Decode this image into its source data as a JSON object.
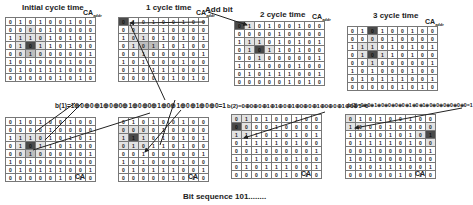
{
  "panels_top": [
    {
      "title": "Initial cycle time",
      "ca_label": "CA",
      "ca_sub": "addr",
      "x": 5,
      "y": 17,
      "title_x": 22,
      "title_y": 4,
      "rows": [
        [
          0,
          1,
          0,
          1,
          0,
          0,
          1,
          0,
          0
        ],
        [
          0,
          0,
          0,
          0,
          1,
          0,
          0,
          0,
          0
        ],
        [
          1,
          1,
          1,
          0,
          1,
          0,
          1,
          0,
          1
        ],
        [
          0,
          1,
          0,
          1,
          1,
          0,
          1,
          0,
          0
        ],
        [
          0,
          0,
          1,
          0,
          0,
          0,
          0,
          0,
          1
        ],
        [
          1,
          0,
          1,
          0,
          0,
          0,
          1,
          0,
          0
        ],
        [
          0,
          1,
          0,
          1,
          1,
          1,
          0,
          0,
          1
        ],
        [
          0,
          0,
          0,
          0,
          0,
          1,
          0,
          1,
          0
        ]
      ],
      "shade": [
        [
          2,
          1,
          "l1"
        ],
        [
          2,
          2,
          "l1"
        ],
        [
          2,
          3,
          "l1"
        ],
        [
          3,
          1,
          "l1"
        ],
        [
          3,
          2,
          "d"
        ],
        [
          3,
          3,
          "l1"
        ],
        [
          4,
          1,
          "l1"
        ],
        [
          4,
          2,
          "l2"
        ],
        [
          4,
          3,
          "l1"
        ],
        [
          1,
          2,
          "l1"
        ]
      ]
    },
    {
      "title": "1 cycle time",
      "ca_label": "CA",
      "ca_sub": "addr",
      "x": 118,
      "y": 17,
      "title_x": 146,
      "title_y": 4,
      "rows": [
        [
          0,
          1,
          0,
          1,
          0,
          0,
          1,
          0,
          0
        ],
        [
          0,
          0,
          0,
          0,
          1,
          0,
          0,
          0,
          0
        ],
        [
          1,
          0,
          1,
          0,
          1,
          0,
          1,
          0,
          1
        ],
        [
          0,
          1,
          0,
          1,
          1,
          0,
          1,
          0,
          0
        ],
        [
          0,
          0,
          1,
          0,
          0,
          0,
          0,
          0,
          1
        ],
        [
          1,
          0,
          1,
          0,
          0,
          0,
          1,
          0,
          0
        ],
        [
          0,
          1,
          0,
          1,
          1,
          1,
          0,
          0,
          1
        ],
        [
          0,
          0,
          0,
          0,
          0,
          1,
          0,
          1,
          0
        ]
      ],
      "shade": [
        [
          0,
          0,
          "d"
        ],
        [
          2,
          1,
          "l1"
        ],
        [
          2,
          2,
          "l1"
        ],
        [
          3,
          1,
          "l1"
        ],
        [
          3,
          2,
          "l2"
        ],
        [
          3,
          3,
          "l2"
        ],
        [
          4,
          2,
          "l1"
        ],
        [
          1,
          1,
          "l1"
        ]
      ]
    },
    {
      "title": "2 cycle time",
      "ca_label": "CA",
      "ca_sub": "addr",
      "x": 234,
      "y": 21,
      "title_x": 260,
      "title_y": 11,
      "rows": [
        [
          0,
          1,
          0,
          1,
          0,
          0,
          1,
          0,
          0
        ],
        [
          0,
          0,
          0,
          0,
          1,
          0,
          0,
          0,
          0
        ],
        [
          1,
          1,
          1,
          0,
          1,
          0,
          1,
          0,
          1
        ],
        [
          0,
          1,
          0,
          1,
          1,
          0,
          1,
          0,
          0
        ],
        [
          0,
          0,
          1,
          0,
          0,
          0,
          0,
          0,
          1
        ],
        [
          1,
          0,
          1,
          0,
          0,
          0,
          1,
          0,
          0
        ],
        [
          0,
          1,
          0,
          1,
          1,
          1,
          0,
          0,
          1
        ],
        [
          0,
          0,
          0,
          0,
          0,
          1,
          0,
          1,
          0
        ]
      ],
      "shade": [
        [
          0,
          0,
          "d"
        ],
        [
          0,
          1,
          "l1"
        ],
        [
          2,
          1,
          "l1"
        ],
        [
          2,
          2,
          "l1"
        ],
        [
          3,
          2,
          "d"
        ],
        [
          3,
          1,
          "l1"
        ],
        [
          3,
          3,
          "l1"
        ],
        [
          4,
          2,
          "l1"
        ]
      ]
    },
    {
      "title": "3 cycle time",
      "ca_label": "CA",
      "ca_sub": "addr",
      "x": 347,
      "y": 26,
      "title_x": 373,
      "title_y": 12,
      "rows": [
        [
          0,
          1,
          0,
          1,
          0,
          0,
          1,
          0,
          0
        ],
        [
          0,
          0,
          0,
          0,
          1,
          0,
          0,
          0,
          0
        ],
        [
          1,
          1,
          1,
          0,
          1,
          0,
          1,
          0,
          1
        ],
        [
          0,
          1,
          0,
          1,
          1,
          0,
          1,
          0,
          0
        ],
        [
          0,
          0,
          1,
          0,
          0,
          0,
          0,
          0,
          1
        ],
        [
          1,
          0,
          1,
          0,
          0,
          0,
          1,
          0,
          0
        ],
        [
          0,
          1,
          0,
          1,
          1,
          1,
          0,
          0,
          1
        ],
        [
          0,
          0,
          0,
          0,
          0,
          1,
          0,
          1,
          0
        ]
      ],
      "shade": [
        [
          0,
          2,
          "d"
        ],
        [
          1,
          2,
          "l1"
        ],
        [
          2,
          1,
          "l1"
        ],
        [
          2,
          2,
          "l1"
        ],
        [
          3,
          2,
          "d"
        ],
        [
          3,
          1,
          "l1"
        ],
        [
          3,
          3,
          "l1"
        ],
        [
          4,
          2,
          "l1"
        ]
      ]
    }
  ],
  "panels_bottom": [
    {
      "ca_label": "CA",
      "x": 5,
      "y": 117,
      "rows": [
        [
          0,
          1,
          0,
          1,
          0,
          0,
          1,
          0,
          0
        ],
        [
          0,
          0,
          0,
          0,
          1,
          0,
          0,
          0,
          0
        ],
        [
          1,
          1,
          1,
          0,
          1,
          0,
          1,
          0,
          1
        ],
        [
          0,
          1,
          0,
          1,
          1,
          0,
          1,
          0,
          0
        ],
        [
          0,
          0,
          1,
          0,
          0,
          0,
          0,
          0,
          1
        ],
        [
          1,
          0,
          1,
          0,
          0,
          0,
          1,
          0,
          0
        ],
        [
          0,
          1,
          0,
          1,
          1,
          1,
          0,
          0,
          1
        ],
        [
          0,
          0,
          0,
          0,
          0,
          1,
          0,
          1,
          0
        ]
      ],
      "shade": [
        [
          2,
          1,
          "l1"
        ],
        [
          2,
          2,
          "l1"
        ],
        [
          2,
          3,
          "l1"
        ],
        [
          3,
          1,
          "l1"
        ],
        [
          3,
          2,
          "d"
        ],
        [
          3,
          3,
          "l1"
        ],
        [
          4,
          1,
          "l1"
        ],
        [
          4,
          2,
          "l2"
        ],
        [
          4,
          3,
          "l1"
        ]
      ]
    },
    {
      "ca_label": "CA",
      "x": 118,
      "y": 117,
      "rows": [
        [
          0,
          1,
          0,
          1,
          0,
          0,
          1,
          0,
          0
        ],
        [
          0,
          0,
          0,
          0,
          1,
          0,
          0,
          0,
          0
        ],
        [
          1,
          1,
          1,
          0,
          1,
          0,
          1,
          0,
          1
        ],
        [
          0,
          1,
          0,
          1,
          1,
          0,
          1,
          0,
          0
        ],
        [
          0,
          0,
          1,
          0,
          0,
          0,
          0,
          0,
          1
        ],
        [
          1,
          0,
          1,
          0,
          0,
          0,
          1,
          0,
          0
        ],
        [
          0,
          1,
          0,
          1,
          1,
          1,
          0,
          0,
          1
        ],
        [
          0,
          0,
          0,
          0,
          0,
          1,
          0,
          1,
          0
        ]
      ],
      "shade": [
        [
          1,
          0,
          "l1"
        ],
        [
          1,
          1,
          "l1"
        ],
        [
          1,
          2,
          "l1"
        ],
        [
          2,
          0,
          "l1"
        ],
        [
          2,
          1,
          "d"
        ],
        [
          2,
          2,
          "l1"
        ],
        [
          3,
          0,
          "l1"
        ],
        [
          3,
          1,
          "l1"
        ],
        [
          3,
          2,
          "l1"
        ]
      ]
    },
    {
      "ca_label": "CA",
      "x": 231,
      "y": 114,
      "rows": [
        [
          0,
          1,
          0,
          1,
          0,
          0,
          1,
          0,
          0
        ],
        [
          0,
          0,
          0,
          0,
          1,
          0,
          0,
          0,
          0
        ],
        [
          1,
          1,
          1,
          0,
          1,
          0,
          1,
          0,
          1
        ],
        [
          0,
          1,
          1,
          1,
          1,
          0,
          1,
          0,
          0
        ],
        [
          0,
          0,
          1,
          0,
          0,
          0,
          0,
          0,
          1
        ],
        [
          1,
          0,
          1,
          0,
          0,
          0,
          1,
          0,
          0
        ],
        [
          0,
          1,
          0,
          1,
          1,
          1,
          0,
          0,
          1
        ],
        [
          0,
          0,
          0,
          0,
          0,
          1,
          0,
          1,
          0
        ]
      ],
      "shade": [
        [
          0,
          0,
          "l1"
        ],
        [
          0,
          1,
          "l1"
        ],
        [
          1,
          0,
          "d"
        ],
        [
          1,
          1,
          "l1"
        ],
        [
          2,
          0,
          "l1"
        ],
        [
          2,
          1,
          "l1"
        ]
      ]
    },
    {
      "ca_label": "CA",
      "x": 345,
      "y": 114,
      "rows": [
        [
          0,
          1,
          0,
          1,
          0,
          0,
          1,
          0,
          0
        ],
        [
          1,
          0,
          0,
          0,
          1,
          0,
          0,
          0,
          0
        ],
        [
          1,
          0,
          1,
          0,
          1,
          0,
          1,
          0,
          1
        ],
        [
          0,
          1,
          1,
          1,
          1,
          0,
          1,
          0,
          0
        ],
        [
          0,
          0,
          1,
          0,
          0,
          0,
          0,
          0,
          1
        ],
        [
          1,
          0,
          1,
          0,
          0,
          0,
          1,
          0,
          0
        ],
        [
          0,
          1,
          0,
          1,
          1,
          1,
          0,
          0,
          1
        ],
        [
          0,
          0,
          0,
          0,
          0,
          1,
          0,
          1,
          0
        ]
      ],
      "shade": [
        [
          1,
          0,
          "l1"
        ],
        [
          1,
          1,
          "l1"
        ],
        [
          0,
          0,
          "l1"
        ],
        [
          2,
          8,
          "d"
        ],
        [
          1,
          8,
          "l1"
        ],
        [
          3,
          8,
          "l1"
        ],
        [
          2,
          7,
          "l1"
        ]
      ]
    }
  ],
  "labels": {
    "add_bit": "Add bit",
    "formula_1": "b(1)=1⊕0⊕0⊕1⊕0⊕0⊕1⊕0⊕0⊕1⊕0⊕1⊕0⊕1⊕0⊕0=1",
    "formula_2": "b(2)=0⊕0⊕0⊕1⊕1⊕0⊕1⊕0⊕0⊕1⊕0⊕0⊕1⊕0⊕1=0",
    "formula_3": "b(3)=0⊕0⊕1⊕0⊕0⊕0⊕0⊕1⊕0⊕1⊕0⊕0⊕0⊕0⊕0⊕0=1",
    "caption": "Bit sequence 101........"
  },
  "colors": {
    "dark_cell": "#4a4a4a",
    "mid_cell": "#bdbdbd",
    "light_cell": "#e2e2e2",
    "grid_line": "#777777",
    "arrow": "#222222"
  }
}
